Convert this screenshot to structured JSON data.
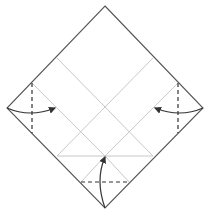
{
  "diagram": {
    "type": "origami-fold-diagram",
    "colors": {
      "outline": "#555555",
      "crease": "#c8c8c8",
      "fold_line": "#333333",
      "arrow": "#333333",
      "background": "#ffffff"
    },
    "square": {
      "top": [
        105,
        6
      ],
      "right": [
        203,
        108
      ],
      "bottom": [
        105,
        208
      ],
      "left": [
        7,
        108
      ]
    },
    "creases": [
      {
        "from": [
          57,
          58
        ],
        "to": [
          153,
          156
        ]
      },
      {
        "from": [
          153,
          58
        ],
        "to": [
          57,
          156
        ]
      },
      {
        "from": [
          32,
          83
        ],
        "to": [
          105,
          156
        ]
      },
      {
        "from": [
          178,
          83
        ],
        "to": [
          105,
          156
        ]
      },
      {
        "from": [
          57,
          156
        ],
        "to": [
          153,
          156
        ]
      },
      {
        "from": [
          81,
          182
        ],
        "to": [
          105,
          156
        ]
      },
      {
        "from": [
          129,
          182
        ],
        "to": [
          105,
          156
        ]
      }
    ],
    "valley_folds": [
      {
        "name": "left-fold-line",
        "from": [
          32,
          83
        ],
        "to": [
          32,
          133
        ]
      },
      {
        "name": "right-fold-line",
        "from": [
          178,
          83
        ],
        "to": [
          178,
          133
        ]
      },
      {
        "name": "bottom-fold-line",
        "from": [
          81,
          182
        ],
        "to": [
          129,
          182
        ]
      }
    ],
    "arrows": [
      {
        "name": "left-fold-arrow",
        "from": [
          7,
          108
        ],
        "ctrl": [
          30,
          118
        ],
        "to": [
          55,
          108
        ]
      },
      {
        "name": "right-fold-arrow",
        "from": [
          203,
          108
        ],
        "ctrl": [
          180,
          118
        ],
        "to": [
          155,
          108
        ]
      },
      {
        "name": "bottom-fold-arrow",
        "from": [
          105,
          208
        ],
        "ctrl": [
          95,
          180
        ],
        "to": [
          105,
          157
        ]
      }
    ]
  }
}
